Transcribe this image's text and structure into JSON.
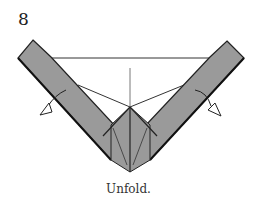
{
  "step": {
    "number": "8"
  },
  "caption": {
    "text": "Unfold."
  },
  "colors": {
    "paper_fill": "#9a9a9a",
    "outline": "#222222",
    "crease": "#444444",
    "arrow_fill": "#ffffff"
  },
  "diagram": {
    "elements": [
      "left-strip",
      "right-strip",
      "center-diamond",
      "horizontal-edge",
      "center-vertical-crease",
      "left-unfold-arrow",
      "right-unfold-arrow"
    ]
  }
}
